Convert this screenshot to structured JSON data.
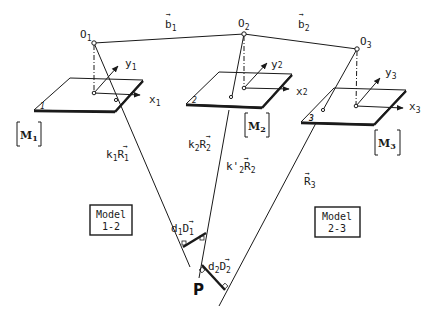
{
  "diagram": {
    "projection_centers": [
      {
        "id": "O1",
        "label": "O",
        "sub": "1"
      },
      {
        "id": "O2",
        "label": "O",
        "sub": "2"
      },
      {
        "id": "O3",
        "label": "O",
        "sub": "3"
      }
    ],
    "base_vectors": [
      {
        "label": "b",
        "sub": "1",
        "arrow": "→"
      },
      {
        "label": "b",
        "sub": "2",
        "arrow": "→"
      }
    ],
    "photos": [
      {
        "matrix": "M",
        "sub": "1",
        "corner_mark": "1",
        "x_axis": "x",
        "x_sub": "1",
        "y_axis": "y",
        "y_sub": "1"
      },
      {
        "matrix": "M",
        "sub": "2",
        "corner_mark": "2",
        "x_axis": "x",
        "x_sub": "2",
        "y_axis": "y",
        "y_sub": "2"
      },
      {
        "matrix": "M",
        "sub": "3",
        "corner_mark": "3",
        "x_axis": "x",
        "x_sub": "3",
        "y_axis": "y",
        "y_sub": "3"
      }
    ],
    "rays": [
      {
        "label": "k₁R₁",
        "pre": "k",
        "pre_sub": "1",
        "vec": "R",
        "vec_sub": "1"
      },
      {
        "label": "k₂R₂",
        "pre": "k",
        "pre_sub": "2",
        "vec": "R",
        "vec_sub": "2"
      },
      {
        "label": "k'₂R₂",
        "pre": "k'",
        "pre_sub": "2",
        "vec": "R",
        "vec_sub": "2"
      },
      {
        "label": "R₃",
        "pre": "",
        "pre_sub": "",
        "vec": "R",
        "vec_sub": "3"
      }
    ],
    "separations": [
      {
        "pre": "d",
        "pre_sub": "1",
        "vec": "D",
        "vec_sub": "1"
      },
      {
        "pre": "d",
        "pre_sub": "2",
        "vec": "D",
        "vec_sub": "2"
      }
    ],
    "models": [
      {
        "line1": "Model",
        "line2": "1-2"
      },
      {
        "line1": "Model",
        "line2": "2-3"
      }
    ],
    "ground_point": "P",
    "arrow_glyph": "→"
  }
}
